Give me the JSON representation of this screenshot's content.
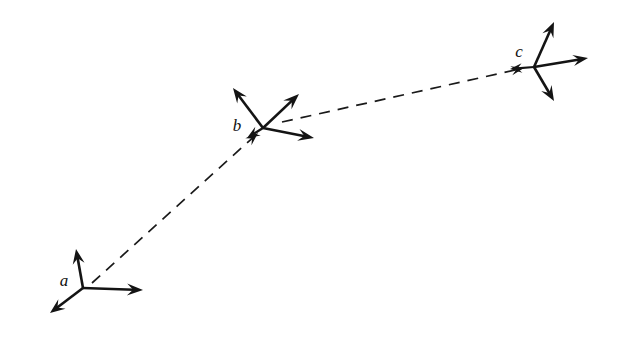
{
  "figure": {
    "background_color": "#ffffff",
    "ink_color": "#141414",
    "width": 621,
    "height": 339,
    "frames": [
      {
        "id": "a",
        "label": "a",
        "label_x": 64,
        "label_y": 282,
        "origin_x": 83,
        "origin_y": 288,
        "axes": [
          {
            "name": "axis-up",
            "tip_x": 76,
            "tip_y": 249,
            "head_len": 15,
            "head_w": 6.0
          },
          {
            "name": "axis-right",
            "tip_x": 143,
            "tip_y": 290,
            "head_len": 16,
            "head_w": 6.0
          },
          {
            "name": "axis-down-left",
            "tip_x": 50,
            "tip_y": 313,
            "head_len": 15,
            "head_w": 6.0
          }
        ]
      },
      {
        "id": "b",
        "label": "b",
        "label_x": 237,
        "label_y": 127,
        "origin_x": 263,
        "origin_y": 128,
        "axes": [
          {
            "name": "axis-up-left",
            "tip_x": 233,
            "tip_y": 88,
            "head_len": 15,
            "head_w": 6.0
          },
          {
            "name": "axis-up-right",
            "tip_x": 299,
            "tip_y": 94,
            "head_len": 16,
            "head_w": 6.0
          },
          {
            "name": "axis-right-down",
            "tip_x": 314,
            "tip_y": 138,
            "head_len": 16,
            "head_w": 6.0
          },
          {
            "name": "axis-down-left",
            "tip_x": 247,
            "tip_y": 138,
            "head_len": 13,
            "head_w": 5.2
          }
        ]
      },
      {
        "id": "c",
        "label": "c",
        "label_x": 519,
        "label_y": 53,
        "origin_x": 534,
        "origin_y": 67,
        "axes": [
          {
            "name": "axis-up-right",
            "tip_x": 554,
            "tip_y": 22,
            "head_len": 15,
            "head_w": 6.0
          },
          {
            "name": "axis-right",
            "tip_x": 588,
            "tip_y": 58,
            "head_len": 15,
            "head_w": 5.6
          },
          {
            "name": "axis-down-right",
            "tip_x": 554,
            "tip_y": 101,
            "head_len": 15,
            "head_w": 6.0
          },
          {
            "name": "axis-left",
            "tip_x": 510,
            "tip_y": 69,
            "head_len": 12,
            "head_w": 4.8
          }
        ]
      }
    ],
    "trajectories": [
      {
        "name": "trajectory-a-to-b",
        "from_frame": "a",
        "to_frame": "b",
        "start_x": 92,
        "start_y": 283,
        "end_x": 258,
        "end_y": 133,
        "dash": "11 8",
        "arrowhead": true,
        "head_len": 13,
        "head_w": 4.6
      },
      {
        "name": "trajectory-b-to-c",
        "from_frame": "b",
        "to_frame": "c",
        "start_x": 282,
        "start_y": 122,
        "end_x": 524,
        "end_y": 68,
        "dash": "11 8",
        "arrowhead": true,
        "head_len": 13,
        "head_w": 4.6
      }
    ]
  }
}
